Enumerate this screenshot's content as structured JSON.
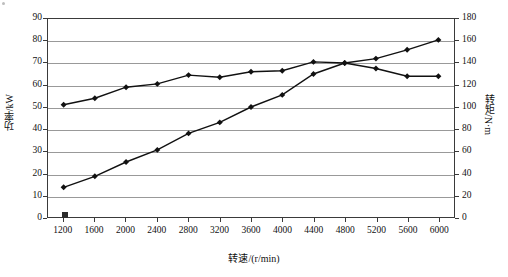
{
  "chart_data": {
    "type": "line",
    "title": "",
    "xlabel": "转速/(r/min)",
    "ylabel": "功率/kW",
    "y2label": "转矩/N·m",
    "grid": true,
    "legend": "none",
    "x": [
      1200,
      1600,
      2000,
      2400,
      2800,
      3200,
      3600,
      4000,
      4400,
      4800,
      5200,
      5600,
      6000
    ],
    "xlim": [
      1000,
      6200
    ],
    "xticks": [
      "1200",
      "1600",
      "2000",
      "2400",
      "2800",
      "3200",
      "3600",
      "4000",
      "4400",
      "4800",
      "5200",
      "5600",
      "6000"
    ],
    "ylim": [
      0,
      90
    ],
    "yticks": [
      "0",
      "10",
      "20",
      "30",
      "40",
      "50",
      "60",
      "70",
      "80",
      "90"
    ],
    "y2lim": [
      0,
      180
    ],
    "y2ticks": [
      "0",
      "20",
      "40",
      "60",
      "80",
      "100",
      "120",
      "140",
      "160",
      "180"
    ],
    "series": [
      {
        "name": "转矩",
        "axis": "right",
        "unit": "N·m",
        "values": [
          102,
          108,
          118,
          121,
          129,
          127,
          132,
          133,
          141,
          140,
          135,
          128,
          128
        ]
      },
      {
        "name": "功率",
        "axis": "left",
        "unit": "kW",
        "values": [
          13.5,
          18.5,
          25,
          30.5,
          38,
          43,
          50,
          55.5,
          65,
          70,
          72,
          76,
          80.5
        ]
      }
    ]
  }
}
